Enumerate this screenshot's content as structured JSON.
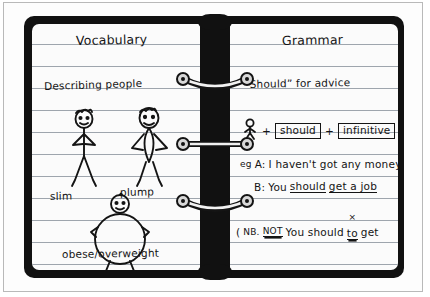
{
  "document": {
    "type": "ring-binder-notebook",
    "pages": 2
  },
  "left_page": {
    "title": "Vocabulary",
    "heading": "Describing people",
    "figure_labels": {
      "slim": "slim",
      "plump": "plump",
      "obese": "obese/overweight"
    },
    "figures": [
      {
        "name": "slim-stick-figure",
        "label": "slim"
      },
      {
        "name": "plump-stick-figure",
        "label": "plump"
      },
      {
        "name": "obese-stick-figure",
        "label": "obese/overweight"
      }
    ]
  },
  "right_page": {
    "title": "Grammar",
    "heading": "“Should”  for advice",
    "formula": {
      "subject_icon": "person-icon",
      "plus_1": "+",
      "box_1": "should",
      "plus_2": "+",
      "box_2": "infinitive"
    },
    "example": {
      "prefix": "eg",
      "line_a_speaker": "A:",
      "line_a_text": "I haven't got any money",
      "line_b_speaker": "B:",
      "line_b_pre": "You ",
      "line_b_should": "should",
      "line_b_mid": " ",
      "line_b_get": "get a job"
    },
    "note": {
      "open_paren": "(",
      "nb": "NB.",
      "not": "NOT",
      "text_pre": "You should",
      "crossed_word": "to",
      "cross_mark": "×",
      "text_post": "get"
    }
  },
  "binder": {
    "rings": [
      {
        "name": "ring-top",
        "style": "curved-down"
      },
      {
        "name": "ring-middle",
        "style": "straight"
      },
      {
        "name": "ring-bottom",
        "style": "curved-down"
      }
    ]
  },
  "colors": {
    "cover": "#111111",
    "paper": "#fbfbfb",
    "rule_line": "#9ea5ad",
    "ink": "#141414",
    "frame": "#b9b9b9"
  }
}
